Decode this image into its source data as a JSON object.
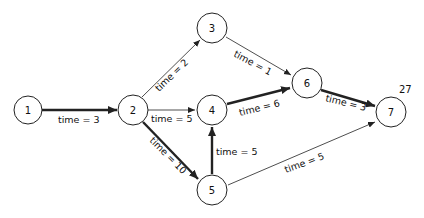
{
  "diagram": {
    "type": "network-critical-path",
    "nodes": [
      {
        "id": "1",
        "label": "1",
        "x": 28,
        "y": 110
      },
      {
        "id": "2",
        "label": "2",
        "x": 133,
        "y": 110
      },
      {
        "id": "3",
        "label": "3",
        "x": 212,
        "y": 28
      },
      {
        "id": "4",
        "label": "4",
        "x": 212,
        "y": 110
      },
      {
        "id": "5",
        "label": "5",
        "x": 212,
        "y": 190
      },
      {
        "id": "6",
        "label": "6",
        "x": 307,
        "y": 83
      },
      {
        "id": "7",
        "label": "7",
        "x": 391,
        "y": 112
      }
    ],
    "edges": [
      {
        "from": "1",
        "to": "2",
        "label": "time = 3",
        "critical": true
      },
      {
        "from": "2",
        "to": "3",
        "label": "time = 2",
        "critical": false
      },
      {
        "from": "2",
        "to": "4",
        "label": "time = 5",
        "critical": false
      },
      {
        "from": "2",
        "to": "5",
        "label": "time = 10",
        "critical": true
      },
      {
        "from": "3",
        "to": "6",
        "label": "time = 1",
        "critical": false
      },
      {
        "from": "4",
        "to": "6",
        "label": "time = 6",
        "critical": true
      },
      {
        "from": "5",
        "to": "4",
        "label": "time = 5",
        "critical": true
      },
      {
        "from": "5",
        "to": "7",
        "label": "time = 5",
        "critical": false
      },
      {
        "from": "6",
        "to": "7",
        "label": "time = 3",
        "critical": true
      }
    ],
    "finish_time": "27"
  }
}
